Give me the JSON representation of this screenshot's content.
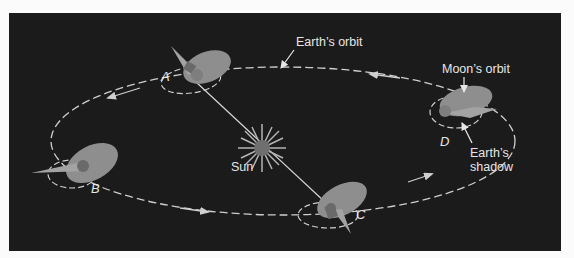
{
  "figure": {
    "type": "diagram",
    "colors": {
      "background_panel": "#1b1b1b",
      "page": "#fbfbfb",
      "orbit_line": "#cfcfcf",
      "moon_orbit_plane": "#8e8e8e",
      "shadow_cone": "#a3a3a3",
      "earth": "#7e7e7e",
      "sun": "#6f6f6f",
      "sun_rays": "#b5b5b5",
      "text": "#e6e6e6"
    }
  },
  "labels": {
    "earth_orbit": "Earth’s orbit",
    "moon_orbit": "Moon’s orbit",
    "sun": "Sun",
    "earth_shadow_line1": "Earth’s",
    "earth_shadow_line2": "shadow"
  },
  "positions": {
    "A": "A",
    "B": "B",
    "C": "C",
    "D": "D"
  }
}
